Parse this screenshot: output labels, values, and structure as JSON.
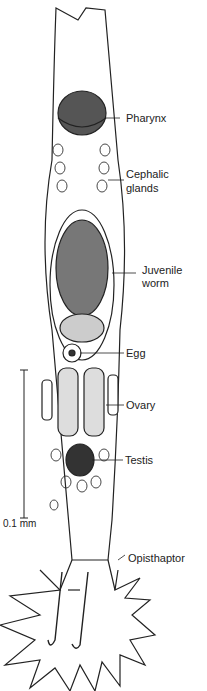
{
  "figure": {
    "labels": {
      "pharynx": "Pharynx",
      "cephalic_glands_1": "Cephalic",
      "cephalic_glands_2": "glands",
      "juvenile_worm_1": "Juvenile",
      "juvenile_worm_2": "worm",
      "egg": "Egg",
      "ovary": "Ovary",
      "testis": "Testis",
      "opisthaptor": "Opisthaptor"
    },
    "scale_bar": {
      "label": "0.1 mm"
    },
    "colors": {
      "ink": "#222222",
      "background": "#ffffff",
      "stipple": "#888888"
    }
  }
}
